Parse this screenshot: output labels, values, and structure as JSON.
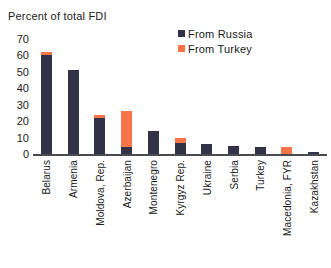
{
  "chart_data": {
    "type": "bar",
    "stacked": true,
    "title": "Percent of total FDI",
    "xlabel": "",
    "ylabel": "Percent of total FDI",
    "ylim": [
      0,
      70
    ],
    "yticks": [
      70,
      60,
      50,
      40,
      30,
      20,
      10,
      0
    ],
    "grid": false,
    "legend_position": "top-right",
    "categories": [
      "Belarus",
      "Armenia",
      "Moldova, Rep.",
      "Azerbaijan",
      "Montenegro",
      "Kyrgyz Rep.",
      "Ukraine",
      "Serbia",
      "Turkey",
      "Macedonia, FYR",
      "Kazakhstan"
    ],
    "series": [
      {
        "name": "From Russia",
        "color": "#323247",
        "values": [
          60,
          51,
          22,
          4,
          14,
          7,
          6,
          5,
          4,
          0,
          1
        ]
      },
      {
        "name": "From Turkey",
        "color": "#FA7449",
        "values": [
          2,
          0,
          2,
          22,
          0,
          3,
          0,
          0,
          0,
          4,
          0
        ]
      }
    ]
  },
  "axis": {
    "title": "Percent of total FDI",
    "tick_labels": [
      "70",
      "60",
      "50",
      "40",
      "30",
      "20",
      "10",
      "0"
    ]
  },
  "legend": {
    "items": [
      {
        "label": "From Russia",
        "color": "#323247"
      },
      {
        "label": "From Turkey",
        "color": "#FA7449"
      }
    ]
  }
}
